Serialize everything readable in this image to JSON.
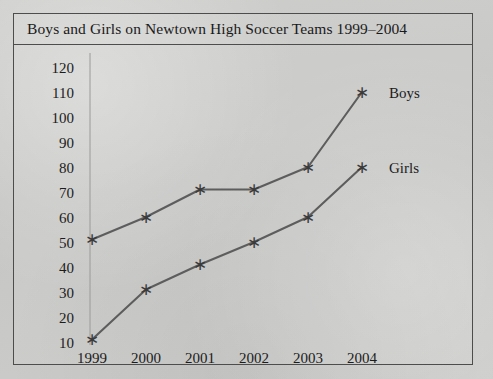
{
  "figure": {
    "title": "Boys and Girls on Newtown High Soccer Teams 1999–2004",
    "frame_color": "#4d4d4d",
    "background_color": "#c9c9c7"
  },
  "chart_data": {
    "type": "line",
    "title": "Boys and Girls on Newtown High Soccer Teams 1999–2004",
    "xlabel": "",
    "ylabel": "",
    "categories": [
      "1999",
      "2000",
      "2001",
      "2002",
      "2003",
      "2004"
    ],
    "x": [
      1999,
      2000,
      2001,
      2002,
      2003,
      2004
    ],
    "series": [
      {
        "name": "Boys",
        "values": [
          51,
          60,
          71,
          71,
          80,
          110
        ],
        "color": "#5d5d5d",
        "marker": "asterisk"
      },
      {
        "name": "Girls",
        "values": [
          11,
          31,
          41,
          50,
          60,
          80
        ],
        "color": "#5d5d5d",
        "marker": "asterisk"
      }
    ],
    "ylim": [
      0,
      125
    ],
    "yticks": [
      10,
      20,
      30,
      40,
      50,
      60,
      70,
      80,
      90,
      100,
      110,
      120
    ],
    "ytick_labels": [
      "10",
      "20",
      "30",
      "40",
      "50",
      "60",
      "70",
      "80",
      "90",
      "100",
      "110",
      "120"
    ],
    "xtick_labels": [
      "1999",
      "2000",
      "2001",
      "2002",
      "2003",
      "2004"
    ],
    "grid": false,
    "legend_position": "inline-right",
    "legend_entries": [
      "Boys",
      "Girls"
    ],
    "marker_glyph": "∗"
  }
}
